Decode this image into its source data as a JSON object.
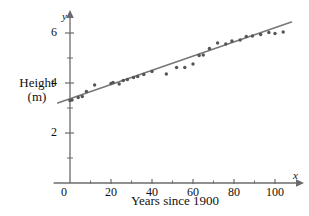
{
  "figure": {
    "background": "#ffffff",
    "axis_color": "#6b6b6b",
    "point_color": "#555555",
    "line_color": "#777777"
  },
  "axes": {
    "y_axis_title": "Height\n(m)",
    "x_axis_title": "Years since 1900",
    "y_variable_symbol": "y",
    "x_variable_symbol": "x",
    "origin_label": "0",
    "x_tick_labels": [
      "20",
      "40",
      "60",
      "80",
      "100"
    ],
    "y_tick_labels": [
      "2",
      "4",
      "6"
    ]
  },
  "chart_data": {
    "type": "scatter",
    "title": "",
    "xlabel": "Years since 1900",
    "ylabel": "Height (m)",
    "xlim": [
      -8,
      112
    ],
    "ylim": [
      0,
      6.9
    ],
    "grid": false,
    "legend": false,
    "x_ticks": [
      0,
      20,
      40,
      60,
      80,
      100
    ],
    "x_minor_ticks": [
      10,
      30,
      50,
      70,
      90
    ],
    "y_ticks": [
      2,
      4,
      6
    ],
    "y_minor_ticks": [
      1,
      3,
      5
    ],
    "points": [
      {
        "x": 0,
        "y": 3.3
      },
      {
        "x": 1,
        "y": 3.32
      },
      {
        "x": 4,
        "y": 3.42
      },
      {
        "x": 6,
        "y": 3.46
      },
      {
        "x": 8,
        "y": 3.66
      },
      {
        "x": 12,
        "y": 3.92
      },
      {
        "x": 20,
        "y": 3.98
      },
      {
        "x": 21,
        "y": 4.02
      },
      {
        "x": 24,
        "y": 3.96
      },
      {
        "x": 26,
        "y": 4.1
      },
      {
        "x": 28,
        "y": 4.14
      },
      {
        "x": 31,
        "y": 4.22
      },
      {
        "x": 33,
        "y": 4.26
      },
      {
        "x": 36,
        "y": 4.34
      },
      {
        "x": 40,
        "y": 4.46
      },
      {
        "x": 47,
        "y": 4.36
      },
      {
        "x": 52,
        "y": 4.62
      },
      {
        "x": 56,
        "y": 4.62
      },
      {
        "x": 60,
        "y": 4.76
      },
      {
        "x": 63,
        "y": 5.1
      },
      {
        "x": 65,
        "y": 5.12
      },
      {
        "x": 68,
        "y": 5.38
      },
      {
        "x": 72,
        "y": 5.6
      },
      {
        "x": 76,
        "y": 5.56
      },
      {
        "x": 79,
        "y": 5.68
      },
      {
        "x": 83,
        "y": 5.72
      },
      {
        "x": 86,
        "y": 5.86
      },
      {
        "x": 89,
        "y": 5.88
      },
      {
        "x": 93,
        "y": 5.94
      },
      {
        "x": 97,
        "y": 6.02
      },
      {
        "x": 100,
        "y": 5.98
      },
      {
        "x": 104,
        "y": 6.04
      }
    ],
    "trend_line": {
      "label": "line of best fit",
      "x_start": -6,
      "y_start": 3.2,
      "x_end": 108,
      "y_end": 6.44
    }
  }
}
